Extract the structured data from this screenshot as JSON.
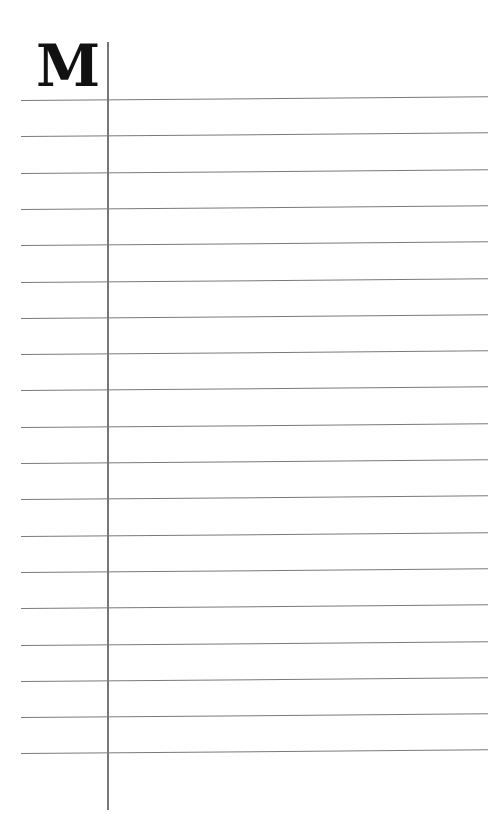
{
  "page": {
    "initial_letter": "M",
    "ruled_lines": {
      "count": 19,
      "first_y": 100,
      "spacing": 36.3,
      "left_x": 21,
      "right_x": 488,
      "color": "#7a7a7a"
    },
    "margin_line": {
      "x": 107,
      "top": 42,
      "bottom": 810,
      "color": "#777777"
    }
  }
}
